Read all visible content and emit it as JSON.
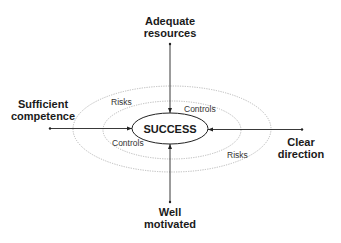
{
  "diagram": {
    "center": {
      "label": "SUCCESS"
    },
    "factors": {
      "top": {
        "line1": "Adequate",
        "line2": "resources"
      },
      "left": {
        "line1": "Sufficient",
        "line2": "competence"
      },
      "right": {
        "line1": "Clear",
        "line2": "direction"
      },
      "bottom": {
        "line1": "Well",
        "line2": "motivated"
      }
    },
    "ring_labels": {
      "risks_upper_left": "Risks",
      "controls_upper_right": "Controls",
      "controls_lower_left": "Controls",
      "risks_lower_right": "Risks"
    },
    "colors": {
      "line": "#222222",
      "dotted_ring": "#b0b0b0",
      "text": "#1a1a1a"
    }
  }
}
